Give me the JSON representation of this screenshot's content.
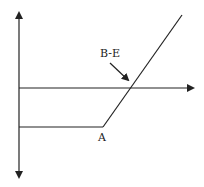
{
  "diagram": {
    "type": "payoff-diagram",
    "colors": {
      "line": "#222222",
      "background": "#ffffff"
    },
    "labels": {
      "breakeven": "B-E",
      "strike": "A"
    },
    "elements": [
      {
        "name": "vertical-axis",
        "description": "double-headed vertical axis"
      },
      {
        "name": "horizontal-axis",
        "description": "horizontal axis with right arrow"
      },
      {
        "name": "payoff-flat-segment",
        "description": "flat line below axis up to point A"
      },
      {
        "name": "payoff-rising-segment",
        "description": "diagonal line rising from A crossing axis at B-E"
      },
      {
        "name": "breakeven-arrow",
        "description": "arrow pointing from B-E label to axis crossing"
      }
    ]
  }
}
